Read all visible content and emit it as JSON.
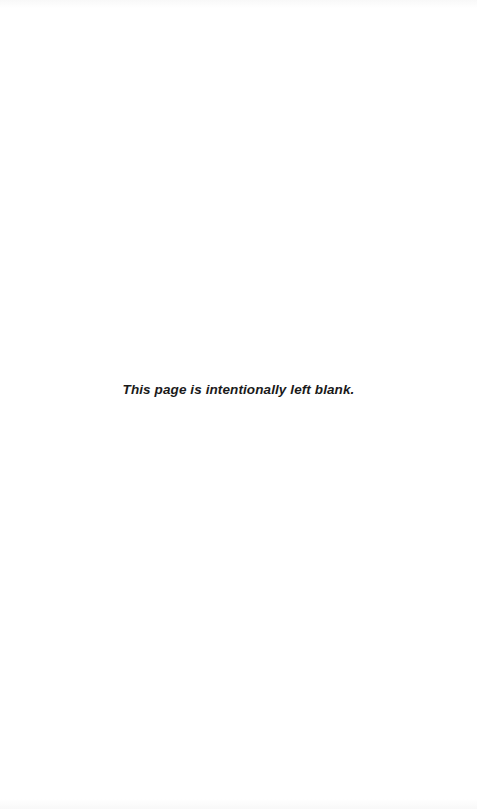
{
  "page": {
    "notice": "This page is intentionally left blank.",
    "background_color": "#ffffff",
    "text_color": "#1a1a1a"
  }
}
